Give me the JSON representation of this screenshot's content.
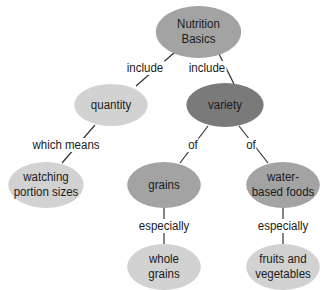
{
  "diagram": {
    "type": "concept-map",
    "nodes": {
      "root": {
        "line1": "Nutrition",
        "line2": "Basics"
      },
      "quantity": {
        "text": "quantity"
      },
      "variety": {
        "text": "variety"
      },
      "portion": {
        "line1": "watching",
        "line2": "portion sizes"
      },
      "grains": {
        "text": "grains"
      },
      "water": {
        "line1": "water-",
        "line2": "based foods"
      },
      "whole": {
        "line1": "whole",
        "line2": "grains"
      },
      "fruits": {
        "line1": "fruits and",
        "line2": "vegetables"
      }
    },
    "links": {
      "root_quantity": "include",
      "root_variety": "include",
      "quantity_portion": "which means",
      "variety_grains": "of",
      "variety_water": "of",
      "grains_whole": "especially",
      "water_fruits": "especially"
    },
    "colors": {
      "light": "#d2d2d2",
      "mid": "#a3a3a3",
      "dark": "#7a7a7a",
      "line": "#333333"
    }
  }
}
